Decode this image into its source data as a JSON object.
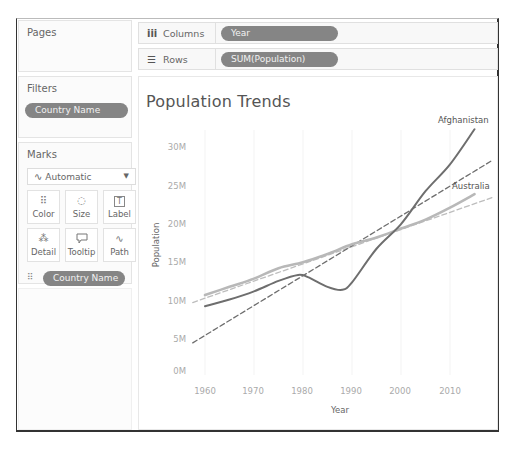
{
  "panes": {
    "pages": {
      "title": "Pages"
    },
    "filters": {
      "title": "Filters",
      "pills": [
        "Country Name"
      ]
    },
    "marks": {
      "title": "Marks",
      "mark_type": "Automatic",
      "mark_type_icon": "line-chart-icon",
      "buttons": [
        {
          "label": "Color",
          "icon": "color-dots-icon",
          "glyph": "⠿"
        },
        {
          "label": "Size",
          "icon": "size-icon",
          "glyph": "◌"
        },
        {
          "label": "Label",
          "icon": "label-icon",
          "glyph": "T"
        },
        {
          "label": "Detail",
          "icon": "detail-icon",
          "glyph": "⁂"
        },
        {
          "label": "Tooltip",
          "icon": "tooltip-icon",
          "glyph": "🗨"
        },
        {
          "label": "Path",
          "icon": "path-icon",
          "glyph": "∿"
        }
      ],
      "encodings": [
        {
          "type": "color",
          "icon": "color-dots-icon",
          "glyph": "⠿",
          "field": "Country Name"
        },
        {
          "type": "label",
          "icon": "label-icon",
          "glyph": "T",
          "field": "Country Name"
        }
      ]
    }
  },
  "shelves": {
    "columns": {
      "label": "Columns",
      "icon_glyph": "iii",
      "pill": "Year"
    },
    "rows": {
      "label": "Rows",
      "icon_glyph": "☰",
      "pill": "SUM(Population)"
    }
  },
  "colors": {
    "afghanistan": "#6e6e6e",
    "australia": "#b8b8b8",
    "trend_afghanistan": "#6e6e6e",
    "trend_australia": "#bdbdbd",
    "pill": "#858585"
  },
  "chart_data": {
    "type": "line",
    "title": "Population Trends",
    "xlabel": "Year",
    "ylabel": "Population",
    "x_ticks": [
      "1960",
      "1970",
      "1980",
      "1990",
      "2000",
      "2010"
    ],
    "y_ticks": [
      "0M",
      "5M",
      "10M",
      "15M",
      "20M",
      "25M",
      "30M"
    ],
    "xlim": [
      1957,
      2019
    ],
    "ylim": [
      0,
      33
    ],
    "grid": false,
    "legend": "inline labels at line ends",
    "series": [
      {
        "name": "Afghanistan",
        "style": "solid",
        "x": [
          1960,
          1965,
          1970,
          1975,
          1979,
          1981,
          1985,
          1988,
          1990,
          1995,
          2000,
          2005,
          2010,
          2015
        ],
        "values": [
          8.8,
          9.7,
          10.8,
          12.2,
          13.0,
          12.7,
          11.4,
          11.0,
          12.0,
          16.5,
          19.8,
          24.2,
          27.8,
          32.5
        ]
      },
      {
        "name": "Australia",
        "style": "solid",
        "x": [
          1960,
          1965,
          1970,
          1975,
          1980,
          1985,
          1990,
          1995,
          2000,
          2005,
          2010,
          2015
        ],
        "values": [
          10.3,
          11.4,
          12.5,
          13.9,
          14.7,
          15.8,
          17.1,
          18.0,
          19.2,
          20.4,
          22.0,
          23.8
        ]
      },
      {
        "name": "Afghanistan trend",
        "style": "dashed",
        "x": [
          1957.5,
          2018.8
        ],
        "values": [
          3.9,
          28.4
        ]
      },
      {
        "name": "Australia trend",
        "style": "dashed",
        "x": [
          1957.5,
          2018.8
        ],
        "values": [
          9.3,
          23.4
        ]
      }
    ],
    "annotations": [
      "Afghanistan",
      "Australia"
    ]
  }
}
